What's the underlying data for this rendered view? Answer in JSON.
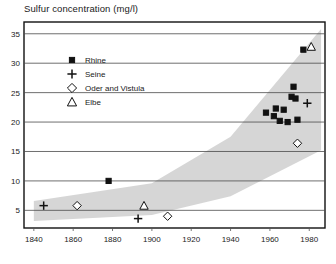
{
  "chart_data": {
    "type": "scatter",
    "title": "Sulfur concentration (mg/l)",
    "xlabel": "",
    "ylabel": "",
    "xlim": [
      1835,
      1988
    ],
    "ylim": [
      2.0,
      37.0
    ],
    "xticks": [
      1840,
      1860,
      1880,
      1900,
      1920,
      1940,
      1960,
      1980
    ],
    "yticks": [
      5,
      10,
      15,
      20,
      25,
      30,
      35
    ],
    "grid": "horizontal",
    "legend_position": "upper-left-inside",
    "series": [
      {
        "name": "Rhine",
        "marker": "filled-square",
        "points": [
          {
            "x": 1878,
            "y": 10.0
          },
          {
            "x": 1958,
            "y": 21.6
          },
          {
            "x": 1962,
            "y": 21.0
          },
          {
            "x": 1963,
            "y": 22.3
          },
          {
            "x": 1965,
            "y": 20.2
          },
          {
            "x": 1967,
            "y": 22.1
          },
          {
            "x": 1969,
            "y": 20.0
          },
          {
            "x": 1971,
            "y": 24.3
          },
          {
            "x": 1972,
            "y": 26.0
          },
          {
            "x": 1973,
            "y": 24.0
          },
          {
            "x": 1974,
            "y": 20.4
          },
          {
            "x": 1977,
            "y": 32.3
          }
        ]
      },
      {
        "name": "Seine",
        "marker": "plus",
        "points": [
          {
            "x": 1845,
            "y": 5.8
          },
          {
            "x": 1893,
            "y": 3.6
          },
          {
            "x": 1979,
            "y": 23.2
          }
        ]
      },
      {
        "name": "Oder and Vistula",
        "marker": "open-diamond",
        "points": [
          {
            "x": 1862,
            "y": 5.8
          },
          {
            "x": 1908,
            "y": 4.0
          },
          {
            "x": 1974,
            "y": 16.4
          }
        ]
      },
      {
        "name": "Elbe",
        "marker": "open-triangle",
        "points": [
          {
            "x": 1896,
            "y": 5.8
          },
          {
            "x": 1981,
            "y": 32.8
          }
        ]
      }
    ],
    "band": {
      "label": "shaded-envelope",
      "color": "#cfcfcf",
      "upper": [
        {
          "x": 1840,
          "y": 6.6
        },
        {
          "x": 1900,
          "y": 9.6
        },
        {
          "x": 1940,
          "y": 17.5
        },
        {
          "x": 1986,
          "y": 35.8
        }
      ],
      "lower": [
        {
          "x": 1840,
          "y": 3.2
        },
        {
          "x": 1900,
          "y": 4.2
        },
        {
          "x": 1940,
          "y": 7.4
        },
        {
          "x": 1986,
          "y": 15.2
        }
      ]
    },
    "legend": [
      {
        "label": "Rhine",
        "marker": "filled-square"
      },
      {
        "label": "Seine",
        "marker": "plus"
      },
      {
        "label": "Oder and Vistula",
        "marker": "open-diamond"
      },
      {
        "label": "Elbe",
        "marker": "open-triangle"
      }
    ]
  }
}
